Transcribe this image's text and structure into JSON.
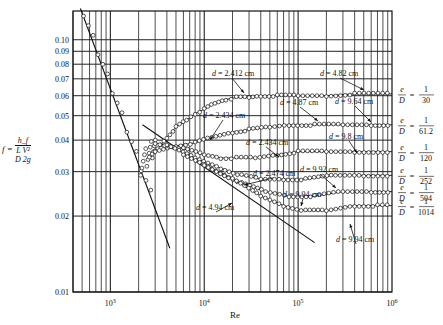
{
  "chart_data": {
    "type": "scatter",
    "title": "",
    "xlabel": "Re",
    "ylabel": "f = h_f / ((L/D)(V^2/2g))",
    "xscale": "log",
    "yscale": "log",
    "xlim": [
      400,
      1000000
    ],
    "ylim": [
      0.01,
      0.13
    ],
    "grid": true,
    "x_ticks": [
      "10^3",
      "10^4",
      "10^5",
      "10^6"
    ],
    "y_ticks": [
      0.01,
      0.02,
      0.03,
      0.04,
      0.05,
      0.06,
      0.07,
      0.08,
      0.09,
      0.1
    ],
    "reference_lines": [
      {
        "name": "laminar f=64/Re",
        "points": [
          [
            480,
            0.133
          ],
          [
            4300,
            0.0149
          ]
        ]
      },
      {
        "name": "smooth pipe (Blasius)",
        "points": [
          [
            2200,
            0.046
          ],
          [
            150000,
            0.0157
          ]
        ]
      }
    ],
    "series": [
      {
        "name": "e/D = 1/30",
        "label_num": "1",
        "label_den": "30",
        "points": [
          [
            2600,
            0.034
          ],
          [
            3200,
            0.037
          ],
          [
            4000,
            0.041
          ],
          [
            5000,
            0.045
          ],
          [
            6500,
            0.048
          ],
          [
            8000,
            0.051
          ],
          [
            10000,
            0.053
          ],
          [
            13000,
            0.056
          ],
          [
            17000,
            0.058
          ],
          [
            22000,
            0.059
          ],
          [
            30000,
            0.059
          ],
          [
            40000,
            0.06
          ],
          [
            60000,
            0.06
          ],
          [
            100000,
            0.06
          ],
          [
            200000,
            0.06
          ],
          [
            400000,
            0.061
          ],
          [
            1000000,
            0.061
          ]
        ]
      },
      {
        "name": "e/D = 1/61.2",
        "label_num": "1",
        "label_den": "61.2",
        "points": [
          [
            3000,
            0.036
          ],
          [
            5000,
            0.038
          ],
          [
            8000,
            0.039
          ],
          [
            12000,
            0.041
          ],
          [
            20000,
            0.043
          ],
          [
            30000,
            0.044
          ],
          [
            50000,
            0.045
          ],
          [
            80000,
            0.046
          ],
          [
            150000,
            0.046
          ],
          [
            300000,
            0.046
          ],
          [
            600000,
            0.046
          ],
          [
            1000000,
            0.046
          ]
        ]
      },
      {
        "name": "e/D = 1/120",
        "label_num": "1",
        "label_den": "120",
        "points": [
          [
            3000,
            0.039
          ],
          [
            6000,
            0.037
          ],
          [
            10000,
            0.035
          ],
          [
            15000,
            0.034
          ],
          [
            22000,
            0.034
          ],
          [
            35000,
            0.034
          ],
          [
            60000,
            0.035
          ],
          [
            100000,
            0.036
          ],
          [
            200000,
            0.036
          ],
          [
            400000,
            0.036
          ],
          [
            1000000,
            0.036
          ]
        ]
      },
      {
        "name": "e/D = 1/252",
        "label_num": "1",
        "label_den": "252",
        "points": [
          [
            4000,
            0.038
          ],
          [
            8000,
            0.034
          ],
          [
            15000,
            0.031
          ],
          [
            25000,
            0.029
          ],
          [
            40000,
            0.028
          ],
          [
            70000,
            0.028
          ],
          [
            120000,
            0.028
          ],
          [
            250000,
            0.029
          ],
          [
            500000,
            0.029
          ],
          [
            1000000,
            0.029
          ]
        ]
      },
      {
        "name": "e/D = 1/504",
        "label_num": "1",
        "label_den": "504",
        "points": [
          [
            6000,
            0.035
          ],
          [
            12000,
            0.031
          ],
          [
            25000,
            0.027
          ],
          [
            45000,
            0.025
          ],
          [
            80000,
            0.024
          ],
          [
            150000,
            0.024
          ],
          [
            300000,
            0.025
          ],
          [
            600000,
            0.025
          ],
          [
            1000000,
            0.025
          ]
        ]
      },
      {
        "name": "e/D = 1/1014",
        "label_num": "1",
        "label_den": "1014",
        "points": [
          [
            10000,
            0.032
          ],
          [
            20000,
            0.028
          ],
          [
            40000,
            0.024
          ],
          [
            70000,
            0.022
          ],
          [
            120000,
            0.021
          ],
          [
            200000,
            0.021
          ],
          [
            400000,
            0.022
          ],
          [
            700000,
            0.022
          ],
          [
            1000000,
            0.022
          ]
        ]
      }
    ],
    "annotations": [
      {
        "text": "d = 2.412 cm",
        "x": 212,
        "y": 76,
        "arrow_to": [
          244,
          93
        ]
      },
      {
        "text": "d = 4.82 cm",
        "x": 320,
        "y": 76,
        "arrow_to": [
          364,
          90
        ]
      },
      {
        "text": "d = 4.87 cm",
        "x": 280,
        "y": 105,
        "arrow_to": [
          318,
          121
        ]
      },
      {
        "text": "d = 9.64 cm",
        "x": 335,
        "y": 104,
        "arrow_to": [
          371,
          122
        ]
      },
      {
        "text": "d = 2.434 cm",
        "x": 203,
        "y": 118,
        "arrow_to": [
          210,
          140
        ]
      },
      {
        "text": "d = 2.434 cm",
        "x": 246,
        "y": 145,
        "arrow_to": [
          279,
          157
        ]
      },
      {
        "text": "d = 9.8 cm",
        "x": 329,
        "y": 139,
        "arrow_to": [
          357,
          153
        ]
      },
      {
        "text": "d = 2.474 cm",
        "x": 253,
        "y": 176,
        "arrow_to": [
          244,
          185
        ]
      },
      {
        "text": "d = 9.92 cm",
        "x": 300,
        "y": 172,
        "arrow_to": [
          336,
          188
        ]
      },
      {
        "text": "d = 9.94 cm",
        "x": 283,
        "y": 197,
        "arrow_to": [
          301,
          206
        ]
      },
      {
        "text": "d = 4.94 cm",
        "x": 196,
        "y": 210,
        "arrow_to": [
          232,
          203
        ]
      },
      {
        "text": "d = 9.94 cm",
        "x": 336,
        "y": 242,
        "arrow_to": [
          350,
          224
        ]
      }
    ]
  },
  "axis": {
    "y_label_prefix": "f =",
    "y_label_num": "h_f",
    "y_label_den_left": "L  V²",
    "y_label_den_right": "D  2g",
    "x_label": "Re"
  }
}
